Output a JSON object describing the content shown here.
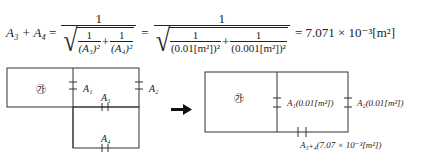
{
  "equation": {
    "lhs": "A₃ + A₄",
    "lhs_parts": {
      "a3": "A",
      "a3_sub": "3",
      "plus": "+",
      "a4": "A",
      "a4_sub": "4"
    },
    "equals": "=",
    "frac1": {
      "numerator": "1",
      "inner1": {
        "num": "1",
        "den": "(A₃)²"
      },
      "inner2": {
        "num": "1",
        "den": "(A₄)²"
      },
      "plus": "+"
    },
    "frac2": {
      "numerator": "1",
      "inner1": {
        "num": "1",
        "den": "(0.01[m²])²"
      },
      "inner2": {
        "num": "1",
        "den": "(0.001[m²])²"
      },
      "plus": "+"
    },
    "result": "= 7.071 × 10⁻³[m²]"
  },
  "left_diagram": {
    "room_label": "㉮",
    "labels": {
      "a1": "A₁",
      "a2": "A₂",
      "a3": "A₃",
      "a4": "A₄"
    }
  },
  "arrow": {
    "icon": "arrow-right-icon"
  },
  "right_diagram": {
    "room_label": "㉮",
    "labels": {
      "a1": "A₁(0.01[m²])",
      "a2": "A₂(0.01[m²])",
      "a34": "A₃₊₄(7.07 × 10⁻³[m²])"
    }
  },
  "colors": {
    "line": "#333333",
    "text": "#222222",
    "background": "#ffffff"
  }
}
